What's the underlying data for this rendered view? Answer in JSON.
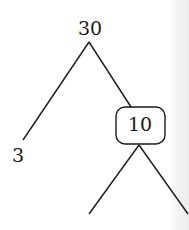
{
  "tree": {
    "root": {
      "value": "30"
    },
    "left_child": {
      "value": "3"
    },
    "right_child": {
      "value": "10",
      "boxed": true
    }
  },
  "colors": {
    "line": "#1a1a1a",
    "background": "#ffffff"
  }
}
